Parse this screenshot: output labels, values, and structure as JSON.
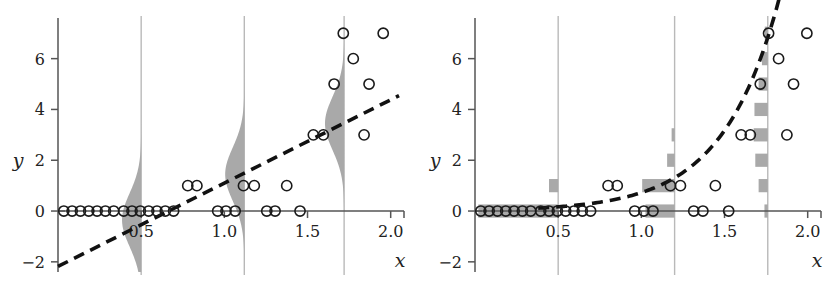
{
  "figure": {
    "title": "",
    "panel_count": 2,
    "colors": {
      "axis": "#555555",
      "marker_stroke": "#1a1a1a",
      "density_fill": "#a9a9a9",
      "bar_fill": "#a9a9a9",
      "gridline": "#b9b9b9",
      "fit_line": "#111111",
      "background": "#ffffff"
    }
  },
  "chart_data": [
    {
      "id": "left-panel",
      "type": "scatter",
      "title": "",
      "xlabel": "x",
      "ylabel": "y",
      "xlim": [
        0.0,
        2.08
      ],
      "ylim": [
        -2.4,
        7.6
      ],
      "xticks": [
        0.5,
        1.0,
        1.5,
        2.0
      ],
      "xticklabels": [
        "0.5",
        "1.0",
        "1.5",
        "2.0"
      ],
      "yticks": [
        -2,
        0,
        2,
        4,
        6
      ],
      "yticklabels": [
        "-2",
        "0",
        "2",
        "4",
        "6"
      ],
      "grid": false,
      "vertical_gridlines": [
        0.5,
        1.12,
        1.72
      ],
      "legend": "none",
      "fit": {
        "kind": "line",
        "style": "dashed",
        "label": "linear fit",
        "slope": 3.28,
        "intercept": -2.18,
        "x_start": 0.0,
        "x_end": 2.05
      },
      "densities": [
        {
          "x": 0.5,
          "orientation": "left",
          "label": "normal density at x=0.5",
          "mean": -0.35,
          "sd": 1.05,
          "max_width": 0.115,
          "y_min": -2.4,
          "y_max": 4.2
        },
        {
          "x": 1.12,
          "orientation": "left",
          "label": "normal density at x=1.12",
          "mean": 1.45,
          "sd": 1.05,
          "max_width": 0.115,
          "y_min": -2.4,
          "y_max": 6.0
        },
        {
          "x": 1.72,
          "orientation": "left",
          "label": "normal density at x=1.72",
          "mean": 3.45,
          "sd": 1.05,
          "max_width": 0.115,
          "y_min": -1.2,
          "y_max": 7.4
        }
      ],
      "points": [
        [
          0.035,
          0
        ],
        [
          0.085,
          0
        ],
        [
          0.135,
          0
        ],
        [
          0.185,
          0
        ],
        [
          0.235,
          0
        ],
        [
          0.285,
          0
        ],
        [
          0.335,
          0
        ],
        [
          0.395,
          0
        ],
        [
          0.445,
          0
        ],
        [
          0.495,
          0
        ],
        [
          0.545,
          0
        ],
        [
          0.595,
          0
        ],
        [
          0.645,
          0
        ],
        [
          0.695,
          0
        ],
        [
          0.78,
          1
        ],
        [
          0.835,
          1
        ],
        [
          0.96,
          0
        ],
        [
          1.01,
          0
        ],
        [
          1.065,
          0
        ],
        [
          1.115,
          1
        ],
        [
          1.18,
          1
        ],
        [
          1.255,
          0
        ],
        [
          1.305,
          0
        ],
        [
          1.375,
          1
        ],
        [
          1.455,
          0
        ],
        [
          1.535,
          3
        ],
        [
          1.595,
          3
        ],
        [
          1.66,
          5
        ],
        [
          1.715,
          7
        ],
        [
          1.775,
          6
        ],
        [
          1.84,
          3
        ],
        [
          1.87,
          5
        ],
        [
          1.955,
          7
        ]
      ]
    },
    {
      "id": "right-panel",
      "type": "scatter",
      "title": "",
      "xlabel": "x",
      "ylabel": "y",
      "xlim": [
        0.0,
        2.08
      ],
      "ylim": [
        -2.4,
        7.6
      ],
      "xticks": [
        0.5,
        1.0,
        1.5,
        2.0
      ],
      "xticklabels": [
        "0.5",
        "1.0",
        "1.5",
        "2.0"
      ],
      "yticks": [
        -2,
        0,
        2,
        4,
        6
      ],
      "yticklabels": [
        "-2",
        "0",
        "2",
        "4",
        "6"
      ],
      "grid": false,
      "vertical_gridlines": [
        0.5,
        1.2,
        1.76
      ],
      "legend": "none",
      "fit": {
        "kind": "exponential",
        "style": "dashed",
        "label": "exponential (Poisson log-link) fit",
        "a": 0.038,
        "b": 2.95,
        "x_start": 0.38,
        "x_end": 2.03
      },
      "pmf_bars": [
        {
          "x": 0.5,
          "orientation": "left",
          "label": "Poisson pmf at x=0.5",
          "bars": [
            {
              "count": 0,
              "width": 0.48
            },
            {
              "count": 1,
              "width": 0.055
            }
          ]
        },
        {
          "x": 1.2,
          "orientation": "left",
          "label": "Poisson pmf at x=1.2",
          "bars": [
            {
              "count": 0,
              "width": 0.175
            },
            {
              "count": 1,
              "width": 0.195
            },
            {
              "count": 2,
              "width": 0.045
            },
            {
              "count": 3,
              "width": 0.018
            }
          ]
        },
        {
          "x": 1.76,
          "orientation": "left",
          "label": "Poisson pmf at x=1.76",
          "bars": [
            {
              "count": 0,
              "width": 0.02
            },
            {
              "count": 1,
              "width": 0.055
            },
            {
              "count": 2,
              "width": 0.075
            },
            {
              "count": 3,
              "width": 0.085
            },
            {
              "count": 4,
              "width": 0.08
            },
            {
              "count": 5,
              "width": 0.055
            },
            {
              "count": 6,
              "width": 0.035
            },
            {
              "count": 7,
              "width": 0.018
            }
          ]
        }
      ],
      "points": [
        [
          0.035,
          0
        ],
        [
          0.085,
          0
        ],
        [
          0.135,
          0
        ],
        [
          0.185,
          0
        ],
        [
          0.235,
          0
        ],
        [
          0.285,
          0
        ],
        [
          0.335,
          0
        ],
        [
          0.395,
          0
        ],
        [
          0.445,
          0
        ],
        [
          0.495,
          0
        ],
        [
          0.545,
          0
        ],
        [
          0.595,
          0
        ],
        [
          0.645,
          0
        ],
        [
          0.695,
          0
        ],
        [
          0.8,
          1
        ],
        [
          0.855,
          1
        ],
        [
          0.96,
          0
        ],
        [
          1.015,
          0
        ],
        [
          1.07,
          0
        ],
        [
          1.175,
          1
        ],
        [
          1.235,
          1
        ],
        [
          1.315,
          0
        ],
        [
          1.37,
          0
        ],
        [
          1.445,
          1
        ],
        [
          1.525,
          0
        ],
        [
          1.6,
          3
        ],
        [
          1.655,
          3
        ],
        [
          1.715,
          5
        ],
        [
          1.765,
          7
        ],
        [
          1.825,
          6
        ],
        [
          1.875,
          3
        ],
        [
          1.915,
          5
        ],
        [
          1.995,
          7
        ]
      ]
    }
  ]
}
